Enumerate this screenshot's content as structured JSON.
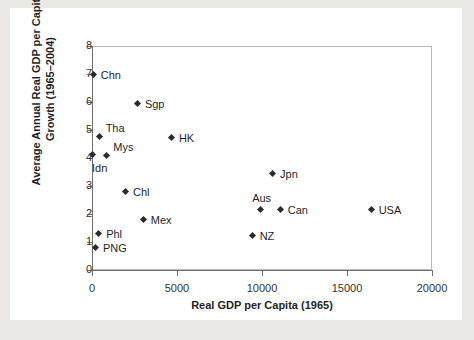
{
  "chart_data": {
    "type": "scatter",
    "title": "",
    "xlabel": "Real GDP per Capita (1965)",
    "ylabel": "Average Annual Real GDP per Capita Growth (1965–2004)",
    "xlim": [
      0,
      20000
    ],
    "ylim": [
      0,
      8
    ],
    "xticks": [
      "0",
      "5000",
      "10000",
      "15000",
      "20000"
    ],
    "xtick_values": [
      0,
      5000,
      10000,
      15000,
      20000
    ],
    "yticks": [
      "0",
      "1",
      "2",
      "3",
      "4",
      "5",
      "6",
      "7",
      "8"
    ],
    "ytick_values": [
      0,
      1,
      2,
      3,
      4,
      5,
      6,
      7,
      8
    ],
    "grid": false,
    "legend": "none",
    "marker": "diamond",
    "marker_color": "#2b2b2b",
    "points": [
      {
        "label": "Chn",
        "x": 100,
        "y": 6.97,
        "label_pos": "right"
      },
      {
        "label": "Sgp",
        "x": 2700,
        "y": 5.93,
        "label_pos": "right"
      },
      {
        "label": "Tha",
        "x": 450,
        "y": 4.75,
        "label_pos": "above-right"
      },
      {
        "label": "HK",
        "x": 4700,
        "y": 4.73,
        "label_pos": "right"
      },
      {
        "label": "Idn",
        "x": 60,
        "y": 4.12,
        "label_pos": "below-right"
      },
      {
        "label": "Mys",
        "x": 900,
        "y": 4.06,
        "label_pos": "above-right"
      },
      {
        "label": "Jpn",
        "x": 10650,
        "y": 3.42,
        "label_pos": "right"
      },
      {
        "label": "Chl",
        "x": 2000,
        "y": 2.79,
        "label_pos": "right"
      },
      {
        "label": "Aus",
        "x": 9950,
        "y": 2.16,
        "label_pos": "above"
      },
      {
        "label": "Can",
        "x": 11100,
        "y": 2.14,
        "label_pos": "right"
      },
      {
        "label": "USA",
        "x": 16450,
        "y": 2.14,
        "label_pos": "right"
      },
      {
        "label": "Mex",
        "x": 3050,
        "y": 1.77,
        "label_pos": "right"
      },
      {
        "label": "Phl",
        "x": 420,
        "y": 1.27,
        "label_pos": "right"
      },
      {
        "label": "NZ",
        "x": 9450,
        "y": 1.23,
        "label_pos": "right"
      },
      {
        "label": "PNG",
        "x": 230,
        "y": 0.79,
        "label_pos": "right"
      }
    ]
  }
}
